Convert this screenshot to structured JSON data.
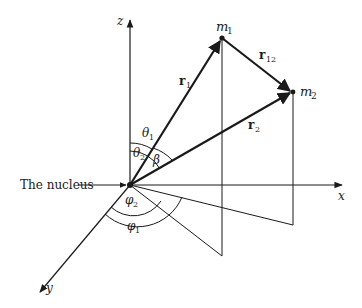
{
  "diagram": {
    "axes": {
      "z_label": "z",
      "x_label": "x",
      "y_label": "y"
    },
    "masses": {
      "m1": {
        "base": "m",
        "sub": "1"
      },
      "m2": {
        "base": "m",
        "sub": "2"
      }
    },
    "vectors": {
      "r1": {
        "base": "r",
        "sub": "1"
      },
      "r2": {
        "base": "r",
        "sub": "2"
      },
      "r12": {
        "base": "r",
        "sub": "12"
      }
    },
    "angles": {
      "theta1": {
        "base": "θ",
        "sub": "1"
      },
      "theta2": {
        "base": "θ",
        "sub": "2"
      },
      "beta": "β",
      "phi1": {
        "base": "φ",
        "sub": "1"
      },
      "phi2": {
        "base": "φ",
        "sub": "2"
      }
    },
    "nucleus_label": "The nucleus",
    "colors": {
      "line": "#1a1a1a",
      "background": "#ffffff"
    }
  }
}
